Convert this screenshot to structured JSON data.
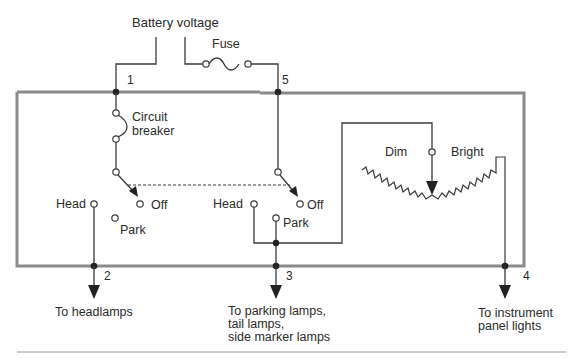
{
  "diagram": {
    "type": "headlamp switch wiring diagram",
    "source_label": "Battery voltage",
    "components": {
      "fuse": "Fuse",
      "circuit_breaker": "Circuit breaker",
      "rheostat_dim": "Dim",
      "rheostat_bright": "Bright"
    },
    "switch_positions": {
      "left": {
        "head": "Head",
        "park": "Park",
        "off": "Off"
      },
      "right": {
        "head": "Head",
        "park": "Park",
        "off": "Off"
      }
    },
    "terminals": [
      "1",
      "2",
      "3",
      "4",
      "5"
    ],
    "outputs": {
      "headlamps": "To headlamps",
      "parking": [
        "To parking lamps,",
        "tail lamps,",
        "side marker lamps"
      ],
      "instrument": [
        "To instrument",
        "panel lights"
      ]
    },
    "colors": {
      "box": "#8a8a8a",
      "wire": "#3a3a3a",
      "node": "#222222"
    }
  }
}
